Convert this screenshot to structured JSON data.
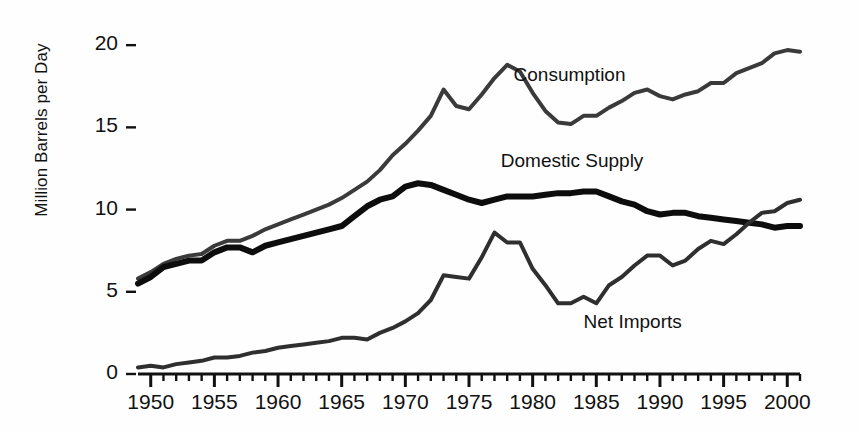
{
  "chart_data": {
    "type": "line",
    "title": "",
    "subtitle": "",
    "xlabel": "",
    "ylabel": "Million Barrels per Day",
    "xlim": [
      1949,
      2001
    ],
    "ylim": [
      0,
      20.8
    ],
    "yticks": [
      0,
      5,
      10,
      15,
      20
    ],
    "ytick_labels": [
      "0",
      "5",
      "10",
      "15",
      "20"
    ],
    "xticks": [
      1950,
      1955,
      1960,
      1965,
      1970,
      1975,
      1980,
      1985,
      1990,
      1995,
      2000
    ],
    "xtick_labels": [
      "1950",
      "1955",
      "1960",
      "1965",
      "1970",
      "1975",
      "1980",
      "1985",
      "1990",
      "1995",
      "2000"
    ],
    "minor_xtick_interval": 1,
    "grid": false,
    "legend_position": "inline-annotations",
    "x": [
      1949,
      1950,
      1951,
      1952,
      1953,
      1954,
      1955,
      1956,
      1957,
      1958,
      1959,
      1960,
      1961,
      1962,
      1963,
      1964,
      1965,
      1966,
      1967,
      1968,
      1969,
      1970,
      1971,
      1972,
      1973,
      1974,
      1975,
      1976,
      1977,
      1978,
      1979,
      1980,
      1981,
      1982,
      1983,
      1984,
      1985,
      1986,
      1987,
      1988,
      1989,
      1990,
      1991,
      1992,
      1993,
      1994,
      1995,
      1996,
      1997,
      1998,
      1999,
      2000,
      2001
    ],
    "series": [
      {
        "name": "Consumption",
        "color": "#3a3a3a",
        "linewidth": 4,
        "label_x": 1978.5,
        "label_y": 18.1,
        "values": [
          5.8,
          6.2,
          6.7,
          7.0,
          7.2,
          7.3,
          7.8,
          8.1,
          8.1,
          8.4,
          8.8,
          9.1,
          9.4,
          9.7,
          10.0,
          10.3,
          10.7,
          11.2,
          11.7,
          12.4,
          13.3,
          14.0,
          14.8,
          15.7,
          17.3,
          16.3,
          16.1,
          17.0,
          18.0,
          18.8,
          18.4,
          17.1,
          16.0,
          15.3,
          15.2,
          15.7,
          15.7,
          16.2,
          16.6,
          17.1,
          17.3,
          16.9,
          16.7,
          17.0,
          17.2,
          17.7,
          17.7,
          18.3,
          18.6,
          18.9,
          19.5,
          19.7,
          19.6
        ]
      },
      {
        "name": "Domestic Supply",
        "color": "#0d0d0d",
        "linewidth": 6,
        "label_x": 1977.5,
        "label_y": 12.9,
        "values": [
          5.5,
          5.9,
          6.5,
          6.7,
          6.9,
          6.9,
          7.4,
          7.7,
          7.7,
          7.4,
          7.8,
          8.0,
          8.2,
          8.4,
          8.6,
          8.8,
          9.0,
          9.6,
          10.2,
          10.6,
          10.8,
          11.4,
          11.6,
          11.5,
          11.2,
          10.9,
          10.6,
          10.4,
          10.6,
          10.8,
          10.8,
          10.8,
          10.9,
          11.0,
          11.0,
          11.1,
          11.1,
          10.8,
          10.5,
          10.3,
          9.9,
          9.7,
          9.8,
          9.8,
          9.6,
          9.5,
          9.4,
          9.3,
          9.2,
          9.1,
          8.9,
          9.0,
          9.0
        ]
      },
      {
        "name": "Net Imports",
        "color": "#2f2f2f",
        "linewidth": 4,
        "label_x": 1984.0,
        "label_y": 3.1,
        "values": [
          0.4,
          0.5,
          0.4,
          0.6,
          0.7,
          0.8,
          1.0,
          1.0,
          1.1,
          1.3,
          1.4,
          1.6,
          1.7,
          1.8,
          1.9,
          2.0,
          2.2,
          2.2,
          2.1,
          2.5,
          2.8,
          3.2,
          3.7,
          4.5,
          6.0,
          5.9,
          5.8,
          7.1,
          8.6,
          8.0,
          8.0,
          6.4,
          5.4,
          4.3,
          4.3,
          4.7,
          4.3,
          5.4,
          5.9,
          6.6,
          7.2,
          7.2,
          6.6,
          6.9,
          7.6,
          8.1,
          7.9,
          8.5,
          9.2,
          9.8,
          9.9,
          10.4,
          10.6
        ]
      }
    ]
  },
  "axis": {
    "y_axis_title": "Million Barrels per Day"
  }
}
